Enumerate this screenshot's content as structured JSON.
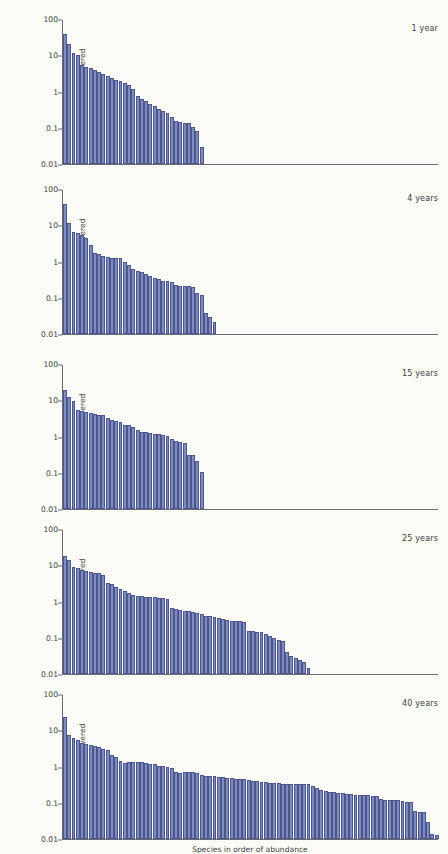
{
  "figure": {
    "background_color": "#fbfbf7",
    "bar_fill": "#7f8cc0",
    "bar_stroke": "#4c558c",
    "axis_color": "#6a6a72"
  },
  "axis": {
    "ylabel": "% of total area covered",
    "xlabel": "Species in order of abundance",
    "yticks": [
      "100",
      "10",
      "1",
      "0.1",
      "0.01"
    ],
    "ymin": 0.01,
    "ymax": 100,
    "scale": "log"
  },
  "caption": {
    "lead": "",
    "body": ""
  },
  "chart_data": {
    "type": "bar",
    "title": "",
    "xlabel": "Species in order of abundance",
    "ylabel": "% of total area covered",
    "yscale": "log",
    "ylim": [
      0.01,
      100
    ],
    "yticks": [
      0.01,
      0.1,
      1,
      10,
      100
    ],
    "grid": false,
    "legend": "none",
    "panel_label_position": "top-right",
    "shared_x_axis_bar_slots": 88,
    "panels": [
      {
        "label": "1 year",
        "n_species": 33,
        "values": [
          40,
          21,
          12,
          11,
          5.5,
          5.0,
          4.6,
          4.2,
          3.6,
          3.1,
          2.7,
          2.4,
          2.2,
          2.0,
          1.8,
          1.55,
          1.25,
          0.8,
          0.62,
          0.55,
          0.46,
          0.4,
          0.34,
          0.3,
          0.26,
          0.2,
          0.155,
          0.145,
          0.142,
          0.14,
          0.105,
          0.085,
          0.03
        ]
      },
      {
        "label": "4 years",
        "n_species": 36,
        "values": [
          41,
          12,
          7.0,
          6.2,
          5.8,
          4.6,
          3.0,
          1.75,
          1.72,
          1.45,
          1.35,
          1.33,
          1.3,
          1.28,
          1.0,
          0.85,
          0.62,
          0.55,
          0.52,
          0.45,
          0.4,
          0.36,
          0.33,
          0.3,
          0.29,
          0.28,
          0.23,
          0.22,
          0.215,
          0.212,
          0.205,
          0.135,
          0.125,
          0.038,
          0.03,
          0.022
        ]
      },
      {
        "label": "15 years",
        "n_species": 33,
        "values": [
          20,
          13,
          10,
          5.5,
          5.3,
          5.1,
          4.6,
          4.4,
          4.2,
          4.1,
          3.4,
          3.0,
          2.8,
          2.6,
          2.2,
          2.1,
          1.9,
          1.55,
          1.4,
          1.35,
          1.3,
          1.25,
          1.18,
          1.12,
          1.05,
          0.88,
          0.8,
          0.72,
          0.7,
          0.32,
          0.31,
          0.22,
          0.11
        ]
      },
      {
        "label": "25 years",
        "n_species": 58,
        "values": [
          19,
          15,
          9.5,
          8.6,
          8.0,
          7.4,
          7.0,
          6.6,
          6.2,
          5.6,
          3.3,
          3.1,
          2.6,
          2.3,
          2.0,
          1.75,
          1.6,
          1.5,
          1.45,
          1.4,
          1.38,
          1.35,
          1.3,
          1.28,
          1.18,
          0.7,
          0.62,
          0.6,
          0.58,
          0.55,
          0.52,
          0.5,
          0.46,
          0.42,
          0.4,
          0.38,
          0.36,
          0.34,
          0.32,
          0.3,
          0.295,
          0.29,
          0.285,
          0.155,
          0.152,
          0.15,
          0.148,
          0.13,
          0.115,
          0.1,
          0.088,
          0.085,
          0.042,
          0.032,
          0.028,
          0.024,
          0.022,
          0.015
        ]
      },
      {
        "label": "40 years",
        "n_species": 88,
        "values": [
          24,
          8.0,
          6.2,
          5.8,
          4.6,
          4.4,
          4.2,
          3.9,
          3.6,
          3.1,
          3.0,
          2.1,
          1.9,
          1.45,
          1.3,
          1.42,
          1.4,
          1.38,
          1.35,
          1.3,
          1.25,
          1.2,
          1.1,
          1.05,
          1.0,
          0.95,
          0.72,
          0.7,
          0.74,
          0.73,
          0.72,
          0.7,
          0.6,
          0.58,
          0.56,
          0.55,
          0.54,
          0.52,
          0.5,
          0.48,
          0.47,
          0.46,
          0.45,
          0.44,
          0.42,
          0.4,
          0.39,
          0.38,
          0.36,
          0.355,
          0.35,
          0.348,
          0.345,
          0.342,
          0.34,
          0.338,
          0.335,
          0.33,
          0.3,
          0.26,
          0.23,
          0.215,
          0.205,
          0.2,
          0.195,
          0.19,
          0.18,
          0.175,
          0.17,
          0.168,
          0.165,
          0.162,
          0.16,
          0.158,
          0.13,
          0.125,
          0.122,
          0.12,
          0.118,
          0.115,
          0.11,
          0.108,
          0.06,
          0.058,
          0.056,
          0.03,
          0.014,
          0.013
        ]
      }
    ]
  }
}
